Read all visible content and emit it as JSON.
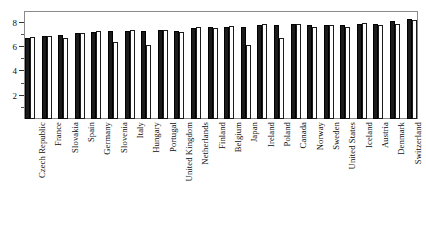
{
  "chart_data": {
    "type": "bar",
    "title": "",
    "subtitle": "",
    "xlabel": "",
    "ylabel": "",
    "ylim": [
      0,
      8.8
    ],
    "yticks": [
      2,
      4,
      6,
      8
    ],
    "ytick_labels": [
      "2",
      "4",
      "6",
      "8"
    ],
    "yminor_ticks": [
      1,
      3,
      5,
      7
    ],
    "grid": false,
    "legend": "none",
    "bar_style": "grouped-pairs",
    "categories": [
      "Czech Republic",
      "France",
      "Slovakia",
      "Spain",
      "Germany",
      "Slovenia",
      "Italy",
      "Hungary",
      "Portugal",
      "United Kingdom",
      "Netherlands",
      "Finland",
      "Belgium",
      "Japan",
      "Ireland",
      "Poland",
      "Canada",
      "Norway",
      "Sweden",
      "United States",
      "Iceland",
      "Austria",
      "Denmark",
      "Switzerland"
    ],
    "series": [
      {
        "name": "series-1",
        "color": "#1b1b1b",
        "fill": "solid-dark",
        "values": [
          6.7,
          6.8,
          6.95,
          7.1,
          7.15,
          7.2,
          7.2,
          7.25,
          7.3,
          7.2,
          7.45,
          7.55,
          7.6,
          7.6,
          7.75,
          7.7,
          7.8,
          7.7,
          7.75,
          7.75,
          7.8,
          7.8,
          8.05,
          8.2
        ]
      },
      {
        "name": "series-2",
        "color": "#ffffff",
        "fill": "hollow-outline",
        "values": [
          6.75,
          6.8,
          6.65,
          7.1,
          7.25,
          6.3,
          7.3,
          6.05,
          7.3,
          7.15,
          7.55,
          7.5,
          7.65,
          6.05,
          7.8,
          6.65,
          7.85,
          7.6,
          7.7,
          7.6,
          7.9,
          7.7,
          7.85,
          8.15
        ]
      }
    ]
  },
  "ghost_text": {
    "clipped_header": ""
  }
}
